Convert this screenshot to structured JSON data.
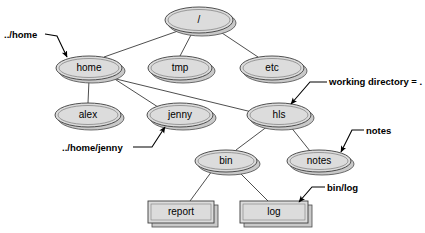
{
  "diagram": {
    "colors": {
      "node_fill": "#dcdcdc",
      "node_stroke": "#3d3d3d",
      "shadow_fill": "#c9c9c9",
      "edge": "#3a3a3a",
      "label_text": "#000000",
      "background": "#ffffff"
    },
    "nodes": [
      {
        "id": "root",
        "label": "/",
        "shape": "ellipse",
        "cx": 199,
        "cy": 20,
        "rx": 34,
        "ry": 13
      },
      {
        "id": "home",
        "label": "home",
        "shape": "ellipse",
        "cx": 89,
        "cy": 68,
        "rx": 33,
        "ry": 12
      },
      {
        "id": "tmp",
        "label": "tmp",
        "shape": "ellipse",
        "cx": 180,
        "cy": 68,
        "rx": 32,
        "ry": 12
      },
      {
        "id": "etc",
        "label": "etc",
        "shape": "ellipse",
        "cx": 272,
        "cy": 68,
        "rx": 32,
        "ry": 12
      },
      {
        "id": "alex",
        "label": "alex",
        "shape": "ellipse",
        "cx": 88,
        "cy": 115,
        "rx": 33,
        "ry": 12
      },
      {
        "id": "jenny",
        "label": "jenny",
        "shape": "ellipse",
        "cx": 180,
        "cy": 115,
        "rx": 33,
        "ry": 12
      },
      {
        "id": "hls",
        "label": "hls",
        "shape": "ellipse",
        "cx": 279,
        "cy": 115,
        "rx": 32,
        "ry": 12
      },
      {
        "id": "bin",
        "label": "bin",
        "shape": "ellipse",
        "cx": 226,
        "cy": 161,
        "rx": 31,
        "ry": 11
      },
      {
        "id": "notes",
        "label": "notes",
        "shape": "ellipse",
        "cx": 319,
        "cy": 161,
        "rx": 32,
        "ry": 11
      },
      {
        "id": "report",
        "label": "report",
        "shape": "box",
        "cx": 181,
        "cy": 212,
        "w": 66,
        "h": 22
      },
      {
        "id": "log",
        "label": "log",
        "shape": "box",
        "cx": 274,
        "cy": 212,
        "w": 68,
        "h": 22
      }
    ],
    "edges": [
      {
        "from": "root",
        "to": "home"
      },
      {
        "from": "root",
        "to": "tmp"
      },
      {
        "from": "root",
        "to": "etc"
      },
      {
        "from": "home",
        "to": "alex"
      },
      {
        "from": "home",
        "to": "jenny"
      },
      {
        "from": "home",
        "to": "hls"
      },
      {
        "from": "hls",
        "to": "bin"
      },
      {
        "from": "hls",
        "to": "notes"
      },
      {
        "from": "bin",
        "to": "report"
      },
      {
        "from": "bin",
        "to": "log"
      }
    ],
    "annotations": [
      {
        "id": "ann-home",
        "text": "../home",
        "text_x": 4,
        "text_y": 35,
        "target": "home"
      },
      {
        "id": "ann-workingdir",
        "text": "working directory = .",
        "text_x": 329,
        "text_y": 82,
        "target": "hls"
      },
      {
        "id": "ann-homejenny",
        "text": "../home/jenny",
        "text_x": 62,
        "text_y": 148,
        "target": "jenny"
      },
      {
        "id": "ann-notes",
        "text": "notes",
        "text_x": 366,
        "text_y": 131,
        "target": "notes"
      },
      {
        "id": "ann-binlog",
        "text": "bin/log",
        "text_x": 327,
        "text_y": 188,
        "target": "log"
      }
    ]
  }
}
